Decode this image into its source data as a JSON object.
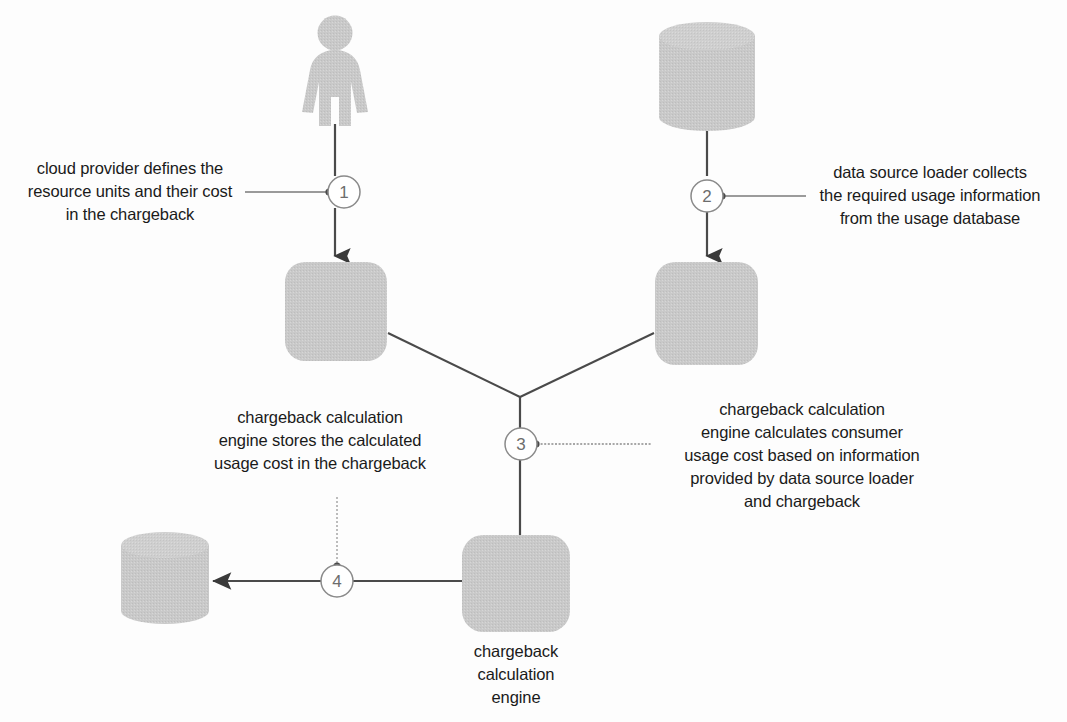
{
  "diagram": {
    "background_color": "#fdfdfd",
    "shape_fill": "#c9c9c9",
    "shape_fill_light": "#d2d2d2",
    "line_color": "#4a4a4a",
    "text_color": "#1a1a1a",
    "circle_stroke": "#8a8a8a"
  },
  "nodes": {
    "cloud_provider_actor": {
      "type": "actor-icon",
      "name": "cloud provider"
    },
    "usage_database_cylinder": {
      "type": "database-cylinder",
      "name": "usage database"
    },
    "chargeback_box": {
      "type": "rounded-square",
      "name": "chargeback"
    },
    "data_source_loader_box": {
      "type": "rounded-square",
      "name": "data source loader"
    },
    "chargeback_calculation_engine_box": {
      "type": "rounded-square",
      "name": "chargeback calculation engine",
      "caption": "chargeback\ncalculation\nengine"
    },
    "chargeback_store_cylinder": {
      "type": "database-cylinder",
      "name": "chargeback"
    }
  },
  "steps": [
    {
      "number": "1",
      "text": "cloud provider defines the\nresource units and their cost\nin the chargeback"
    },
    {
      "number": "2",
      "text": "data source loader collects\nthe required usage information\nfrom the usage database"
    },
    {
      "number": "3",
      "text": "chargeback calculation\nengine calculates consumer\nusage cost based on information\nprovided by data source loader\nand chargeback"
    },
    {
      "number": "3b",
      "text": "chargeback calculation\nengine stores the calculated\nusage cost in the chargeback"
    },
    {
      "number": "4",
      "text": ""
    }
  ],
  "circle_labels": {
    "one": "1",
    "two": "2",
    "three": "3",
    "four": "4"
  }
}
